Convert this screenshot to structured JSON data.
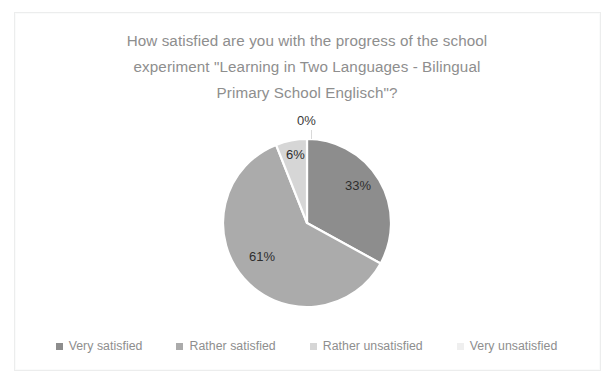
{
  "chart_data": {
    "type": "pie",
    "title": "How satisfied are you with the progress of the school experiment \"Learning in Two Languages - Bilingual Primary School Englisch\"?",
    "title_lines": [
      "How satisfied are you with the progress of the school",
      "experiment \"Learning in Two Languages - Bilingual",
      "Primary School Englisch\"?"
    ],
    "categories": [
      "Very satisfied",
      "Rather satisfied",
      "Rather unsatisfied",
      "Very unsatisfied"
    ],
    "values": [
      33,
      61,
      6,
      0
    ],
    "data_labels": [
      "33%",
      "61%",
      "6%",
      "0%"
    ],
    "colors": [
      "#8d8d8d",
      "#ababab",
      "#d6d6d6",
      "#efefef"
    ],
    "start_angle_deg": 0,
    "direction": "clockwise",
    "slice_border_color": "#ffffff",
    "legend_position": "bottom",
    "grid": false,
    "units": "percent"
  },
  "legend": {
    "items": [
      {
        "label": "Very satisfied",
        "color": "#8d8d8d"
      },
      {
        "label": "Rather satisfied",
        "color": "#ababab"
      },
      {
        "label": "Rather unsatisfied",
        "color": "#d6d6d6"
      },
      {
        "label": "Very unsatisfied",
        "color": "#efefef"
      }
    ]
  },
  "style": {
    "title_color": "#8e8e8e",
    "label_color": "#2e2e2e",
    "legend_text_color": "#8e8e8e",
    "background": "#ffffff",
    "frame_color": "#eceded"
  }
}
